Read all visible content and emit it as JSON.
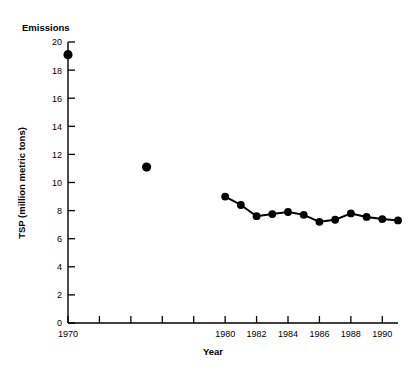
{
  "chart_data": {
    "type": "line",
    "title": "Emissions",
    "xlabel": "Year",
    "ylabel": "TSP (million metric tons)",
    "xlim": [
      1970,
      1991
    ],
    "ylim": [
      0,
      20
    ],
    "grid": false,
    "legend": "none",
    "y_ticks": [
      0,
      2,
      4,
      6,
      8,
      10,
      12,
      14,
      16,
      18,
      20
    ],
    "y_tick_labels": [
      "0",
      "2",
      "4",
      "6",
      "8",
      "10",
      "12",
      "14",
      "16",
      "18",
      "20"
    ],
    "x_ticks": [
      1970,
      1972,
      1974,
      1976,
      1978,
      1980,
      1982,
      1984,
      1986,
      1988,
      1990
    ],
    "x_tick_labels": [
      "1970",
      "",
      "",
      "",
      "",
      "1980",
      "1982",
      "1984",
      "1986",
      "1988",
      "1990"
    ],
    "series": [
      {
        "name": "TSP isolated points",
        "style": "markers-only",
        "x": [
          1970,
          1975
        ],
        "values": [
          19.1,
          11.1
        ]
      },
      {
        "name": "TSP annual series",
        "style": "line-markers",
        "x": [
          1980,
          1981,
          1982,
          1983,
          1984,
          1985,
          1986,
          1987,
          1988,
          1989,
          1990,
          1991
        ],
        "values": [
          9.0,
          8.4,
          7.6,
          7.75,
          7.9,
          7.7,
          7.2,
          7.35,
          7.8,
          7.55,
          7.4,
          7.3
        ]
      }
    ],
    "colors": {
      "marker": "#000000",
      "line": "#000000",
      "axis": "#000000",
      "background": "#ffffff"
    }
  }
}
